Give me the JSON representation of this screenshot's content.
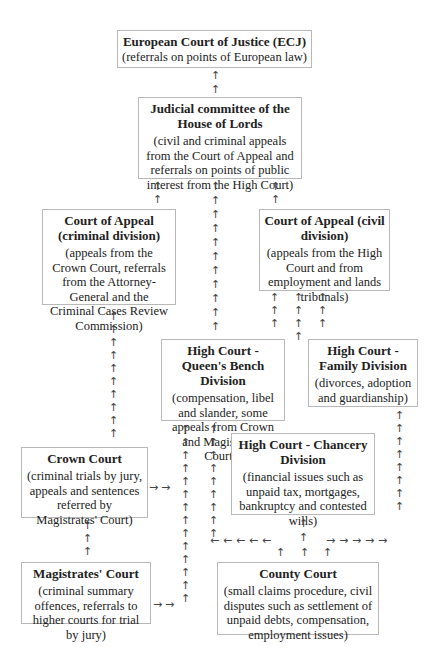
{
  "nodes": {
    "ecj": {
      "title": "European Court of Justice (ECJ)",
      "desc": "(referrals on points of European law)"
    },
    "lords": {
      "title": "Judicial committee of the House of Lords",
      "desc": "(civil and criminal appeals from the Court of Appeal and referrals on points of public interest from the High Court)"
    },
    "appeal_criminal": {
      "title": "Court of Appeal (criminal division)",
      "desc": "(appeals from the Crown Court, referrals from the Attorney-General and the Criminal Cases Review Commission)"
    },
    "appeal_civil": {
      "title": "Court of Appeal (civil division)",
      "desc": "(appeals from the High Court and from employment and lands tribunals)"
    },
    "qbd": {
      "title": "High Court - Queen's Bench Division",
      "desc": "(compensation, libel and slander, some appeals from Crown and Magistrates' Courts)"
    },
    "family": {
      "title": "High Court - Family Division",
      "desc": "(divorces, adoption and guardianship)"
    },
    "chancery": {
      "title": "High Court - Chancery Division",
      "desc": "(financial issues such as unpaid tax, mortgages, bankruptcy and contested wills)"
    },
    "crown": {
      "title": "Crown Court",
      "desc": "(criminal trials by jury, appeals and sentences referred by Magistrates' Court)"
    },
    "magistrates": {
      "title": "Magistrates' Court",
      "desc": "(criminal summary offences, referrals to higher courts for trial by jury)"
    },
    "county": {
      "title": "County Court",
      "desc": "(small claims procedure, civil disputes such as settlement of unpaid debts,  compensation, employment issues)"
    }
  },
  "arrows": {
    "up": "↑",
    "right": "→",
    "left": "←"
  }
}
